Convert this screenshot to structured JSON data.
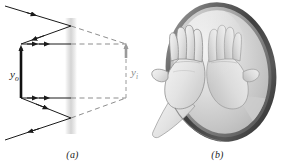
{
  "figure": {
    "background_color": "#ffffff",
    "panels": [
      {
        "id": "a",
        "caption": "(a)",
        "type": "ray-diagram",
        "description": "plane mirror ray diagram with object arrow and virtual image arrow",
        "labels": {
          "object_arrow": "y",
          "object_arrow_subscript": "o",
          "image_arrow": "y",
          "image_arrow_subscript": "i"
        },
        "colors": {
          "object_ray": "#1a1a1a",
          "object_arrow": "#111111",
          "image_ray_dashed": "#8d8d8d",
          "image_arrow": "#9a9a9a",
          "mirror_band": "#d8d8d8"
        }
      },
      {
        "id": "b",
        "caption": "(b)",
        "type": "photo-illustration",
        "description": "hand touching an oval plane mirror with its mirror reflection",
        "colors": {
          "mirror_frame": "#4f4f4f",
          "mirror_frame_highlight": "#8e8e8e",
          "mirror_glass": "#d6d6d6",
          "hand_fill": "#e2e2e2",
          "hand_outline": "#8a8a8a"
        }
      }
    ]
  }
}
